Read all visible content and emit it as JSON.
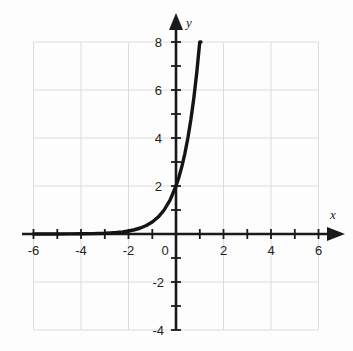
{
  "figure": {
    "title": "",
    "background_color": "#fdfdfd",
    "axis_color": "#1a1a1a",
    "grid_color": "#dcdcdc",
    "curve_color": "#141414"
  },
  "axes": {
    "x_name": "x",
    "y_name": "y",
    "origin_label": "0"
  },
  "chart_data": {
    "type": "line",
    "title": "",
    "xlabel": "x",
    "ylabel": "y",
    "xlim": [
      -6,
      6
    ],
    "ylim": [
      -4,
      8
    ],
    "grid": true,
    "grid_step": 2,
    "tick_step": 1,
    "legend": "none",
    "x_ticks": [
      -6,
      -4,
      -2,
      0,
      2,
      4,
      6
    ],
    "x_tick_labels": [
      "-6",
      "-4",
      "-2",
      "0",
      "2",
      "4",
      "6"
    ],
    "y_ticks": [
      -4,
      -2,
      2,
      4,
      6,
      8
    ],
    "y_tick_labels": [
      "-4",
      "-2",
      "2",
      "4",
      "6",
      "8"
    ],
    "series": [
      {
        "name": "y = 2 * 4^x",
        "equation": "y = 2 · 4^x",
        "asymptote": 0,
        "y_intercept": 2,
        "x": [
          -6,
          -5.5,
          -5,
          -4.5,
          -4,
          -3.5,
          -3,
          -2.75,
          -2.5,
          -2.25,
          -2,
          -1.75,
          -1.5,
          -1.25,
          -1,
          -0.75,
          -0.5,
          -0.25,
          0,
          0.125,
          0.25,
          0.375,
          0.5,
          0.625,
          0.75,
          0.875,
          1,
          1.05
        ],
        "y": [
          0.0005,
          0.001,
          0.002,
          0.004,
          0.008,
          0.016,
          0.031,
          0.044,
          0.063,
          0.088,
          0.125,
          0.177,
          0.25,
          0.354,
          0.5,
          0.707,
          1.0,
          1.414,
          2.0,
          2.378,
          2.828,
          3.364,
          4.0,
          4.757,
          5.657,
          6.727,
          8.0,
          8.0
        ]
      }
    ],
    "annotations": []
  }
}
